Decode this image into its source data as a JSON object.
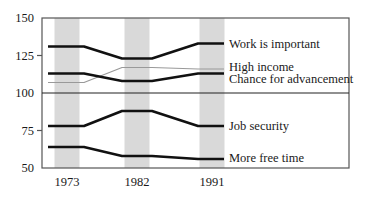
{
  "chart_data": {
    "type": "line",
    "title": "",
    "xlabel": "",
    "ylabel": "",
    "categories": [
      "1973",
      "1982",
      "1991"
    ],
    "ylim": [
      50,
      150
    ],
    "yticks": [
      "150",
      "125",
      "100",
      "75",
      "50"
    ],
    "ytick_values": [
      150,
      125,
      100,
      75,
      50
    ],
    "reference_line": 100,
    "grid": false,
    "legend_position": "inline-right",
    "highlight_band_color": "#d9d9d9",
    "frame_color": "#555555",
    "line_color": "#111111",
    "thin_line_color": "#999999",
    "series": [
      {
        "name": "Work is important",
        "values": [
          131,
          123,
          133
        ],
        "style": "thick"
      },
      {
        "name": "High income",
        "values": [
          107,
          117,
          116
        ],
        "style": "thin"
      },
      {
        "name": "Chance for advancement",
        "values": [
          113,
          108,
          113
        ],
        "style": "thick"
      },
      {
        "name": "Job security",
        "values": [
          78,
          88,
          78
        ],
        "style": "thick"
      },
      {
        "name": "More free time",
        "values": [
          64,
          58,
          56
        ],
        "style": "thick"
      }
    ]
  }
}
